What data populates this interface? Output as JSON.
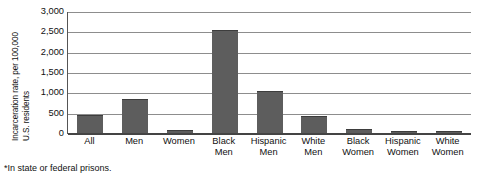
{
  "chart_data": {
    "type": "bar",
    "title": "",
    "xlabel": "",
    "ylabel": "Incarceration rate, per 100,000 U.S. residents",
    "ylabel_lines": [
      "Incarceration rate, per 100,000",
      "U.S. residents"
    ],
    "ylim": [
      0,
      3000
    ],
    "ytick_values": [
      3000,
      2500,
      2000,
      1500,
      1000,
      500,
      0
    ],
    "ytick_labels": [
      "3,000",
      "2,500",
      "2,000",
      "1,500",
      "1,000",
      "500",
      "0"
    ],
    "grid": true,
    "legend": "none",
    "bar_color": "#5d5d5d",
    "categories": [
      "All",
      "Men",
      "Women",
      "Black Men",
      "Hispanic Men",
      "White Men",
      "Black Women",
      "Hispanic Women",
      "White Women"
    ],
    "category_label_lines": [
      [
        "All"
      ],
      [
        "Men"
      ],
      [
        "Women"
      ],
      [
        "Black",
        "Men"
      ],
      [
        "Hispanic",
        "Men"
      ],
      [
        "White",
        "Men"
      ],
      [
        "Black",
        "Women"
      ],
      [
        "Hispanic",
        "Women"
      ],
      [
        "White",
        "Women"
      ]
    ],
    "values": [
      470,
      850,
      100,
      2550,
      1050,
      450,
      120,
      75,
      65
    ],
    "annotations": [
      "*In state or federal prisons."
    ]
  },
  "footnote": {
    "text": "*In state or federal prisons."
  }
}
